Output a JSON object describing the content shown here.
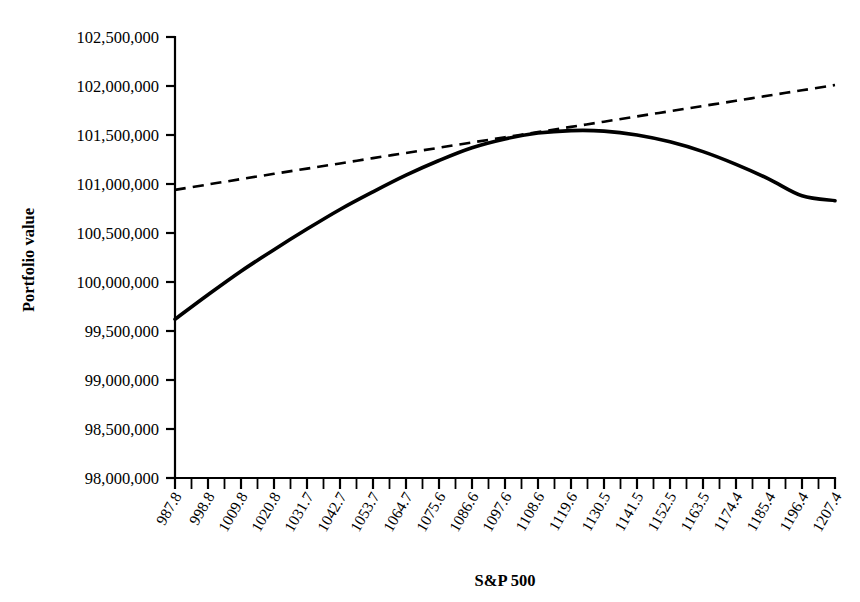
{
  "chart_data": {
    "type": "line",
    "title": "",
    "xlabel": "S&P 500",
    "ylabel": "Portfolio value",
    "xlim": [
      987.8,
      1207.4
    ],
    "ylim": [
      98000000,
      102500000
    ],
    "grid": false,
    "legend": "none",
    "x_tick_labels": [
      "987.8",
      "998.8",
      "1009.8",
      "1020.8",
      "1031.7",
      "1042.7",
      "1053.7",
      "1064.7",
      "1075.6",
      "1086.6",
      "1097.6",
      "1108.6",
      "1119.6",
      "1130.5",
      "1141.5",
      "1152.5",
      "1163.5",
      "1174.4",
      "1185.4",
      "1196.4",
      "1207.4"
    ],
    "y_tick_labels": [
      "102,500,000",
      "102,000,000",
      "101,500,000",
      "101,000,000",
      "100,500,000",
      "100,000,000",
      "99,500,000",
      "99,000,000",
      "98,500,000",
      "98,000,000"
    ],
    "y_tick_values": [
      102500000,
      102000000,
      101500000,
      101000000,
      100500000,
      100000000,
      99500000,
      99000000,
      98500000,
      98000000
    ],
    "x": [
      987.8,
      998.8,
      1009.8,
      1020.8,
      1031.7,
      1042.7,
      1053.7,
      1064.7,
      1075.6,
      1086.6,
      1097.6,
      1108.6,
      1119.6,
      1130.5,
      1141.5,
      1152.5,
      1163.5,
      1174.4,
      1185.4,
      1196.4,
      1207.4
    ],
    "series": [
      {
        "name": "Portfolio value (full revaluation)",
        "style": "solid",
        "values": [
          99620000,
          99870000,
          100110000,
          100330000,
          100540000,
          100740000,
          100920000,
          101090000,
          101240000,
          101370000,
          101460000,
          101520000,
          101545000,
          101540000,
          101500000,
          101430000,
          101330000,
          101200000,
          101050000,
          100880000,
          100830000
        ]
      },
      {
        "name": "Portfolio value (linear approximation)",
        "style": "dashed",
        "values": [
          100940000,
          100995000,
          101050000,
          101104000,
          101157000,
          101210000,
          101264000,
          101317000,
          101370000,
          101424000,
          101477000,
          101530000,
          101583000,
          101636000,
          101690000,
          101743000,
          101796000,
          101849000,
          101903000,
          101956000,
          102010000
        ]
      }
    ]
  },
  "axes": {
    "y_title": "Portfolio value",
    "x_title": "S&P 500"
  }
}
